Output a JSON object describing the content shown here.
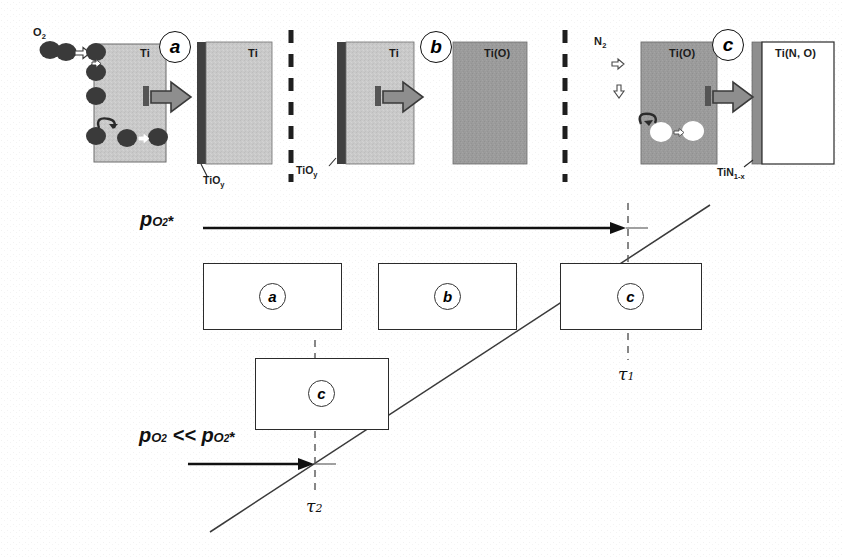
{
  "figure": {
    "kind": "schematic-mechanism-diagram",
    "panels": [
      {
        "id": "a",
        "letter": "a",
        "gas_label": "O2",
        "left_block_label": "Ti",
        "right_block_label": "Ti",
        "interface_label": "TiOy",
        "arrow": "block-arrow-right",
        "species": "dark-oxygen-atoms"
      },
      {
        "id": "b",
        "letter": "b",
        "left_block_label": "Ti",
        "right_block_label": "Ti(O)",
        "interface_label": "TiOy",
        "arrow": "block-arrow-right"
      },
      {
        "id": "c",
        "letter": "c",
        "gas_label": "N2",
        "left_block_label": "Ti(O)",
        "right_block_label": "Ti(N, O)",
        "interface_label": "TiN1-x",
        "arrow": "block-arrow-right",
        "species": "white-vacancy-circles"
      }
    ],
    "timeline": {
      "upper_axis_label": "pO2*",
      "lower_axis_label": "pO2 << pO2*",
      "upper_boxes": [
        {
          "letter": "a"
        },
        {
          "letter": "b"
        },
        {
          "letter": "c"
        }
      ],
      "lower_boxes": [
        {
          "letter": "c"
        }
      ],
      "markers": [
        {
          "name": "tau1",
          "symbol": "τ1"
        },
        {
          "name": "tau2",
          "symbol": "τ2"
        }
      ]
    },
    "colors": {
      "light_gray": "#c9c9c9",
      "mid_gray": "#9a9a9a",
      "dark_gray": "#4a4a4a",
      "atom_dark": "#3a3a3a",
      "line": "#1f1f1f",
      "white": "#ffffff"
    },
    "labels": {
      "ti": "Ti",
      "ti_o": "Ti(O)",
      "ti_no": "Ti(N, O)",
      "tioy": "TiOy",
      "tin1x": "TiN1-x",
      "o2": "O2",
      "n2": "N2",
      "tau1": "τ1",
      "tau2": "τ2",
      "letter_a": "a",
      "letter_b": "b",
      "letter_c": "c"
    }
  }
}
